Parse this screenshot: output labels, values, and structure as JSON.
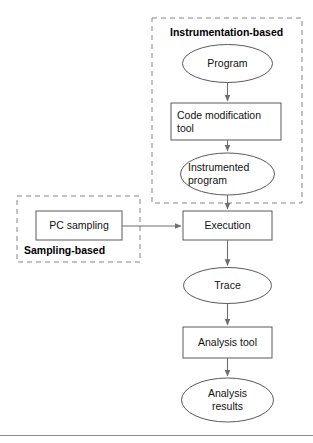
{
  "figure": {
    "type": "flowchart",
    "caption_rule": true,
    "colors": {
      "stroke": "#5a5a5a",
      "text": "#111111",
      "dashed_group_stroke": "#808080",
      "arrow": "#666666",
      "background": "#ffffff",
      "rule": "#888888"
    },
    "groups": [
      {
        "id": "instrumentation",
        "label": "Instrumentation-based",
        "label_position": "top",
        "x": 152,
        "y": 18,
        "width": 150,
        "height": 185
      },
      {
        "id": "sampling",
        "label": "Sampling-based",
        "label_position": "bottom",
        "x": 17,
        "y": 196,
        "width": 123,
        "height": 66
      }
    ],
    "nodes": [
      {
        "id": "program",
        "label": "Program",
        "shape": "ellipse",
        "align": "center",
        "cx": 227.5,
        "cy": 63.5,
        "rx": 45,
        "ry": 19
      },
      {
        "id": "code-modification-tool",
        "label": "Code modification\ntool",
        "shape": "rect",
        "align": "left",
        "x": 171,
        "y": 103,
        "width": 110,
        "height": 37
      },
      {
        "id": "instrumented-program",
        "label": "Instrumented\nprogram",
        "shape": "ellipse",
        "align": "left",
        "cx": 227.5,
        "cy": 174,
        "rx": 47,
        "ry": 21
      },
      {
        "id": "pc-sampling",
        "label": "PC sampling",
        "shape": "rect",
        "align": "center",
        "x": 36,
        "y": 211,
        "width": 86,
        "height": 29
      },
      {
        "id": "execution",
        "label": "Execution",
        "shape": "rect",
        "align": "center",
        "x": 183,
        "y": 211,
        "width": 89,
        "height": 29
      },
      {
        "id": "trace",
        "label": "Trace",
        "shape": "ellipse",
        "align": "center",
        "cx": 227.5,
        "cy": 285.5,
        "rx": 44,
        "ry": 18
      },
      {
        "id": "analysis-tool",
        "label": "Analysis tool",
        "shape": "rect",
        "align": "center",
        "x": 183,
        "y": 327,
        "width": 89,
        "height": 31
      },
      {
        "id": "analysis-results",
        "label": "Analysis\nresults",
        "shape": "ellipse",
        "align": "center",
        "cx": 227.5,
        "cy": 400,
        "rx": 46,
        "ry": 22
      }
    ],
    "edges": [
      {
        "id": "program-to-code-modification-tool",
        "from": "program",
        "to": "code-modification-tool",
        "direction": "down"
      },
      {
        "id": "code-modification-tool-to-instrumented-program",
        "from": "code-modification-tool",
        "to": "instrumented-program",
        "direction": "down"
      },
      {
        "id": "instrumented-program-to-execution",
        "from": "instrumented-program",
        "to": "execution",
        "direction": "down"
      },
      {
        "id": "pc-sampling-to-execution",
        "from": "pc-sampling",
        "to": "execution",
        "direction": "right"
      },
      {
        "id": "execution-to-trace",
        "from": "execution",
        "to": "trace",
        "direction": "down"
      },
      {
        "id": "trace-to-analysis-tool",
        "from": "trace",
        "to": "analysis-tool",
        "direction": "down"
      },
      {
        "id": "analysis-tool-to-analysis-results",
        "from": "analysis-tool",
        "to": "analysis-results",
        "direction": "down"
      }
    ]
  }
}
